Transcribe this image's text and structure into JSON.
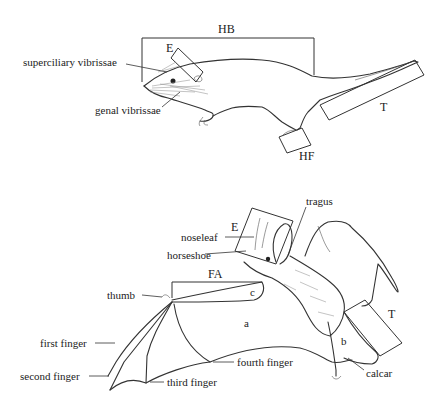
{
  "figure": {
    "rodent": {
      "labels": {
        "hb": "HB",
        "e": "E",
        "superciliary": "superciliary vibrissae",
        "genal": "genal vibrissae",
        "t": "T",
        "hf": "HF"
      }
    },
    "bat": {
      "labels": {
        "tragus": "tragus",
        "e": "E",
        "noseleaf": "noseleaf",
        "horseshoe": "horseshoe",
        "fa": "FA",
        "thumb": "thumb",
        "c": "c",
        "a": "a",
        "b": "b",
        "t": "T",
        "first_finger": "first finger",
        "second_finger": "second finger",
        "third_finger": "third finger",
        "fourth_finger": "fourth finger",
        "calcar": "calcar"
      }
    }
  }
}
